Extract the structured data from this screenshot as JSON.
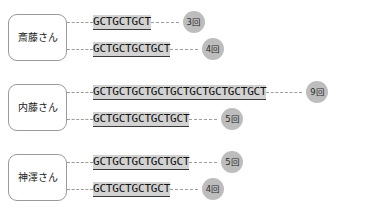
{
  "diagram": {
    "kind": "str-repeat-allele-diagram",
    "repeat_unit": "GCT",
    "count_suffix": "回",
    "people": [
      {
        "name": "斎藤さん",
        "alleles": [
          {
            "sequence": "GCTGCTGCT",
            "count_label": "3回",
            "repeats": 3
          },
          {
            "sequence": "GCTGCTGCTGCT",
            "count_label": "4回",
            "repeats": 4
          }
        ]
      },
      {
        "name": "内藤さん",
        "alleles": [
          {
            "sequence": "GCTGCTGCTGCTGCTGCTGCTGCTGCT",
            "count_label": "9回",
            "repeats": 9
          },
          {
            "sequence": "GCTGCTGCTGCTGCT",
            "count_label": "5回",
            "repeats": 5
          }
        ]
      },
      {
        "name": "神澤さん",
        "alleles": [
          {
            "sequence": "GCTGCTGCTGCTGCT",
            "count_label": "5回",
            "repeats": 5
          },
          {
            "sequence": "GCTGCTGCTGCT",
            "count_label": "4回",
            "repeats": 4
          }
        ]
      }
    ],
    "colors": {
      "sequence_highlight": "#d2d2d2",
      "badge_fill": "#bdbdbd",
      "line": "#9d9d9d",
      "box_border": "#9a9a9a",
      "text": "#111111",
      "background": "#ffffff"
    }
  }
}
